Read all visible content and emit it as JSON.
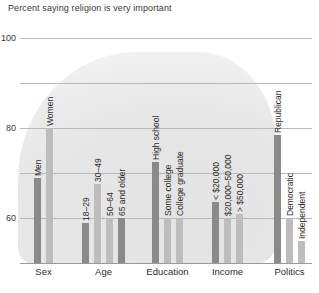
{
  "chart_data": {
    "type": "bar",
    "title": "Percent saying religion is very important",
    "xlabel": "",
    "ylabel": "",
    "ylim": [
      0,
      100
    ],
    "yticks": [
      0,
      20,
      40,
      60,
      80,
      100
    ],
    "grid": true,
    "legend": false,
    "categories": [
      "Sex",
      "Age",
      "Education",
      "Income",
      "Politics"
    ],
    "groups": [
      {
        "name": "Sex",
        "bars": [
          {
            "label": "Men",
            "value": 38,
            "color": "#8a8a8a"
          },
          {
            "label": "Women",
            "value": 60,
            "color": "#bdbdbd"
          }
        ]
      },
      {
        "name": "Age",
        "bars": [
          {
            "label": "18–29",
            "value": 18,
            "color": "#8a8a8a"
          },
          {
            "label": "30–49",
            "value": 35,
            "color": "#bdbdbd"
          },
          {
            "label": "50–64",
            "value": 20,
            "color": "#bdbdbd"
          },
          {
            "label": "65 and older",
            "value": 20,
            "color": "#8a8a8a"
          }
        ]
      },
      {
        "name": "Education",
        "bars": [
          {
            "label": "High school",
            "value": 45,
            "color": "#8a8a8a"
          },
          {
            "label": "Some college",
            "value": 20,
            "color": "#bdbdbd"
          },
          {
            "label": "College graduate",
            "value": 20,
            "color": "#bdbdbd"
          }
        ]
      },
      {
        "name": "Income",
        "bars": [
          {
            "label": "< $20,000",
            "value": 27,
            "color": "#8a8a8a"
          },
          {
            "label": "$20,000–50,000",
            "value": 20,
            "color": "#bdbdbd"
          },
          {
            "label": "> $50,000",
            "value": 22,
            "color": "#bdbdbd"
          }
        ]
      },
      {
        "name": "Politics",
        "bars": [
          {
            "label": "Republican",
            "value": 57,
            "color": "#8a8a8a"
          },
          {
            "label": "Democratic",
            "value": 20,
            "color": "#bdbdbd"
          },
          {
            "label": "Independent",
            "value": 10,
            "color": "#bdbdbd"
          }
        ]
      }
    ]
  },
  "colors": {
    "dark_bar": "#8a8a8a",
    "light_bar": "#bdbdbd",
    "gridline": "#b9b9b9",
    "text": "#2c2c2c",
    "background": "#ffffff"
  }
}
